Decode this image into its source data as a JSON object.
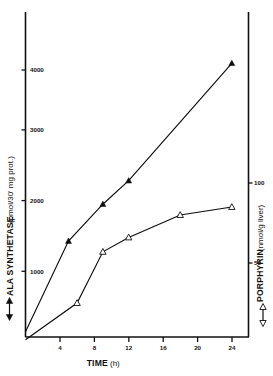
{
  "chart_data": {
    "type": "line",
    "title": "",
    "xlabel": "TIME (h)",
    "xlabel_main": "TIME",
    "xlabel_unit": "(h)",
    "xlim": [
      0,
      26
    ],
    "xticks": [
      4,
      8,
      12,
      16,
      20,
      24
    ],
    "xticklabels": [
      "4",
      "8",
      "12",
      "16",
      "20",
      "24"
    ],
    "grid": false,
    "legend_position": "axis-labels",
    "axes": [
      {
        "id": "left",
        "label": "ALA SYNTHETASE (pmol/30' mg prot.)",
        "label_main": "ALA SYNTHETASE",
        "label_unit": "(pmol/30' mg prot.)",
        "ylim": [
          0,
          4600
        ],
        "yticks": [
          1000,
          2000,
          3000,
          4000
        ],
        "yticklabels": [
          "1000",
          "2000",
          "3000",
          "4000"
        ],
        "legend_marker": "filled-triangle"
      },
      {
        "id": "right",
        "label": "PORPHYRIN (nmol/g liver)",
        "label_main": "PORPHYRIN",
        "label_unit": "(nmol/g liver)",
        "ylim": [
          0,
          125
        ],
        "yticks": [
          50,
          100
        ],
        "yticklabels": [
          "50",
          "100"
        ],
        "legend_marker": "open-triangle"
      }
    ],
    "series": [
      {
        "name": "ALA SYNTHETASE",
        "axis": "left",
        "marker": "filled-triangle",
        "x": [
          0,
          5,
          9,
          12,
          24
        ],
        "values": [
          100,
          1450,
          2000,
          2350,
          4100
        ]
      },
      {
        "name": "PORPHYRIN",
        "axis": "right",
        "marker": "open-triangle",
        "x": [
          0,
          6,
          9,
          12,
          18,
          24
        ],
        "values": [
          2,
          25,
          57,
          66,
          80,
          85
        ]
      }
    ]
  }
}
